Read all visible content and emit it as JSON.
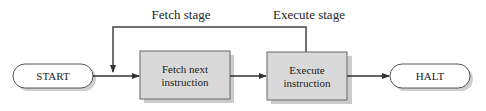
{
  "diagram": {
    "type": "flowchart",
    "nodes": [
      {
        "id": "start",
        "label": "START",
        "shape": "terminator"
      },
      {
        "id": "fetch",
        "label_lines": [
          "Fetch next",
          "instruction"
        ],
        "shape": "process"
      },
      {
        "id": "execute",
        "label_lines": [
          "Execute",
          "instruction"
        ],
        "shape": "process"
      },
      {
        "id": "halt",
        "label": "HALT",
        "shape": "terminator"
      }
    ],
    "edges": [
      {
        "from": "start",
        "to": "fetch"
      },
      {
        "from": "fetch",
        "to": "execute"
      },
      {
        "from": "execute",
        "to": "halt"
      },
      {
        "from": "execute",
        "to": "fetch",
        "type": "feedback-loop"
      }
    ],
    "stage_labels": {
      "fetch": "Fetch stage",
      "execute": "Execute stage"
    },
    "colors": {
      "process_fill": "#d9d9d9",
      "shadow": "#c8c8c8",
      "line": "#333333",
      "terminator_fill": "#ffffff"
    }
  }
}
